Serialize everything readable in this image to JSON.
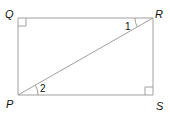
{
  "diagram": {
    "type": "geometry-rectangle-with-diagonal",
    "vertices": {
      "Q": {
        "label": "Q",
        "x": 18,
        "y": 18
      },
      "R": {
        "label": "R",
        "x": 153,
        "y": 18
      },
      "P": {
        "label": "P",
        "x": 18,
        "y": 95
      },
      "S": {
        "label": "S",
        "x": 153,
        "y": 95
      }
    },
    "segments": [
      "QR",
      "RS",
      "SP",
      "PQ",
      "PR"
    ],
    "right_angles": [
      "Q",
      "S"
    ],
    "angles": [
      {
        "label": "1",
        "vertex": "R",
        "between": [
          "RQ",
          "RP"
        ]
      },
      {
        "label": "2",
        "vertex": "P",
        "between": [
          "PS",
          "PR"
        ]
      }
    ],
    "colors": {
      "line": "#a0a0a0",
      "text": "#111111"
    }
  }
}
